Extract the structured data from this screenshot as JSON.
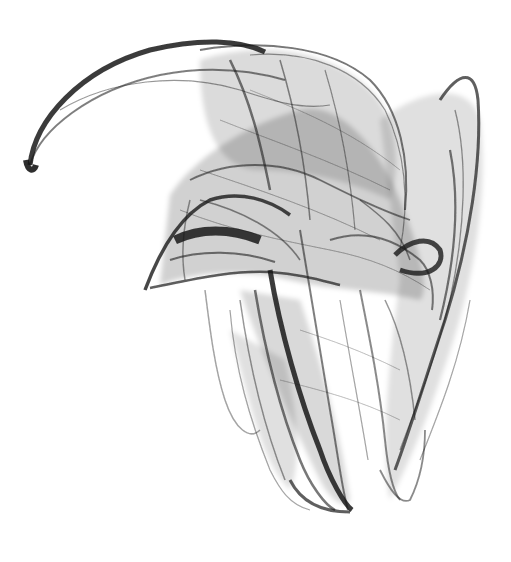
{
  "image": {
    "description": "Grayscale strange attractor render on white background",
    "background_color": "#ffffff",
    "ink_color": "#1a1a1a"
  }
}
